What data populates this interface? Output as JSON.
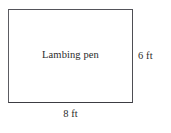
{
  "diagram": {
    "type": "rectangle-geometry-figure",
    "shape": {
      "name": "pen-rectangle",
      "interior_label": "Lambing pen",
      "fill_color": "#ffffff",
      "stroke_color": "#54545a"
    },
    "labels": {
      "height": "6 ft",
      "width": "8 ft"
    },
    "background_color": "#ffffff",
    "text_color": "#2b2b2b"
  }
}
